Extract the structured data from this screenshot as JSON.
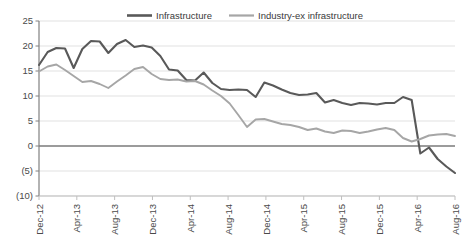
{
  "chart_data": {
    "type": "line",
    "title": "",
    "subtitle": "",
    "xlabel": "",
    "ylabel": "",
    "ylim": [
      -10,
      25
    ],
    "yticks": [
      25,
      20,
      15,
      10,
      5,
      0,
      -5,
      -10
    ],
    "ytick_labels": [
      "25",
      "20",
      "15",
      "10",
      "5",
      "0",
      "(5)",
      "(10)"
    ],
    "grid": true,
    "legend_position": "top-center",
    "x": [
      "Dec-12",
      "Jan-13",
      "Feb-13",
      "Mar-13",
      "Apr-13",
      "May-13",
      "Jun-13",
      "Jul-13",
      "Aug-13",
      "Sep-13",
      "Oct-13",
      "Nov-13",
      "Dec-13",
      "Jan-14",
      "Feb-14",
      "Mar-14",
      "Apr-14",
      "May-14",
      "Jun-14",
      "Jul-14",
      "Aug-14",
      "Sep-14",
      "Oct-14",
      "Nov-14",
      "Dec-14",
      "Jan-15",
      "Feb-15",
      "Mar-15",
      "Apr-15",
      "May-15",
      "Jun-15",
      "Jul-15",
      "Aug-15",
      "Sep-15",
      "Oct-15",
      "Nov-15",
      "Dec-15",
      "Jan-16",
      "Feb-16",
      "Mar-16",
      "Apr-16",
      "May-16",
      "Jun-16",
      "Jul-16",
      "Aug-16"
    ],
    "xtick_labels": [
      "Dec-12",
      "Apr-13",
      "Aug-13",
      "Dec-13",
      "Apr-14",
      "Aug-14",
      "Dec-14",
      "Apr-15",
      "Aug-15",
      "Dec-15",
      "Apr-16",
      "Aug-16"
    ],
    "xtick_indices": [
      0,
      4,
      8,
      12,
      16,
      20,
      24,
      28,
      32,
      36,
      40,
      44
    ],
    "series": [
      {
        "name": "Infrastructure",
        "color": "#595959",
        "values": [
          16.2,
          18.8,
          19.6,
          19.5,
          15.6,
          19.4,
          21.0,
          20.9,
          18.6,
          20.4,
          21.2,
          19.8,
          20.1,
          19.7,
          18.0,
          15.3,
          15.1,
          13.2,
          13.1,
          14.7,
          12.6,
          11.4,
          11.2,
          11.3,
          11.2,
          9.8,
          12.7,
          12.1,
          11.3,
          10.6,
          10.2,
          10.3,
          10.6,
          8.7,
          9.2,
          8.6,
          8.2,
          8.6,
          8.5,
          8.3,
          8.6,
          8.6,
          9.8,
          9.2,
          -1.5
        ],
        "values_tail": [
          -0.3,
          -2.6,
          -4.1,
          -5.4
        ]
      },
      {
        "name": "Industry-ex infrastructure",
        "color": "#a6a6a6",
        "values": [
          14.9,
          15.9,
          16.3,
          15.2,
          14.0,
          12.8,
          13.0,
          12.4,
          11.6,
          12.9,
          14.1,
          15.4,
          15.8,
          14.4,
          13.4,
          13.2,
          13.3,
          12.9,
          13.0,
          12.3,
          11.1,
          10.0,
          8.5,
          6.2,
          3.8,
          5.3,
          5.4,
          4.9,
          4.4,
          4.2,
          3.8,
          3.2,
          3.5,
          2.9,
          2.6,
          3.1,
          3.0,
          2.6,
          2.9,
          3.3,
          3.6,
          3.2,
          1.6,
          0.9,
          1.4
        ],
        "values_tail": [
          2.1,
          2.3,
          2.4,
          2.0
        ]
      }
    ]
  },
  "legend": {
    "items": [
      {
        "label": "Infrastructure",
        "color": "#595959"
      },
      {
        "label": "Industry-ex infrastructure",
        "color": "#a6a6a6"
      }
    ]
  }
}
